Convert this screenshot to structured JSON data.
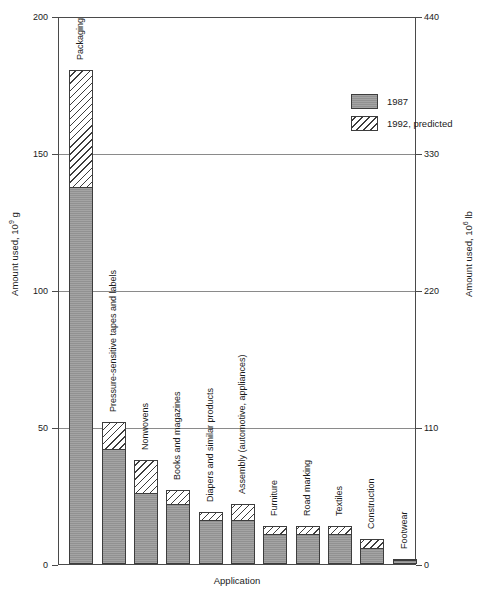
{
  "chart_data": {
    "type": "bar",
    "subtype": "stacked",
    "title": "",
    "xlabel": "Application",
    "ylabel": "Amount used, 10⁹ g",
    "ylabel_right": "Amount used, 10⁶ lb",
    "ylim": [
      0,
      200
    ],
    "ylim_right": [
      0,
      440
    ],
    "yticks": [
      "0",
      "50",
      "100",
      "150",
      "200"
    ],
    "ytick_values": [
      0,
      50,
      100,
      150,
      200
    ],
    "yticks_right": [
      "0",
      "110",
      "220",
      "330",
      "440"
    ],
    "ytick_values_right": [
      0,
      110,
      220,
      330,
      440
    ],
    "grid": true,
    "legend_position": "upper right",
    "categories": [
      "Packaging",
      "Pressure-sensitive tapes and labels",
      "Nonwovens",
      "Books and magazines",
      "Diapers and similar products",
      "Assembly (automotive, appliances)",
      "Furniture",
      "Road marking",
      "Textiles",
      "Construction",
      "Footwear"
    ],
    "series": [
      {
        "name": "1987",
        "color": "#9a9a9a",
        "pattern": "solid-gray",
        "values": [
          138,
          42,
          26,
          22,
          16,
          16,
          11,
          11,
          11,
          6,
          1.5
        ]
      },
      {
        "name": "1992, predicted",
        "color": "#ffffff",
        "pattern": "diagonal-hatch",
        "values": [
          181,
          52,
          38,
          27,
          19,
          22,
          14,
          14,
          14,
          9,
          2
        ]
      }
    ]
  },
  "legend": {
    "items": [
      {
        "label": "1987"
      },
      {
        "label": "1992, predicted"
      }
    ]
  }
}
